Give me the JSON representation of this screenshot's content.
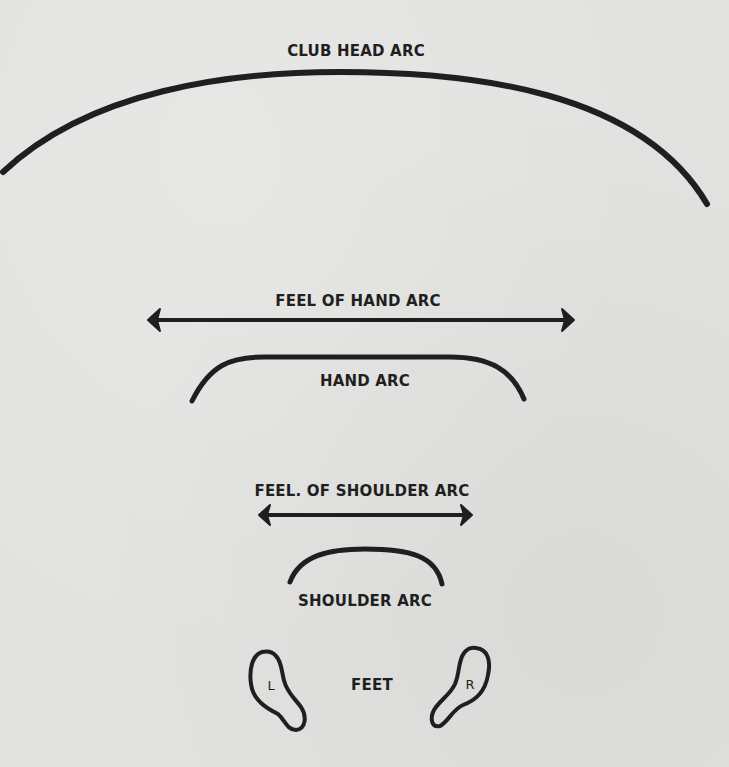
{
  "diagram": {
    "labels": {
      "club_head_arc": "CLUB HEAD ARC",
      "feel_of_hand_arc": "FEEL OF HAND ARC",
      "hand_arc": "HAND ARC",
      "feel_of_shoulder_arc": "FEEL. OF SHOULDER ARC",
      "shoulder_arc": "SHOULDER ARC",
      "feet": "FEET",
      "left_foot": "L",
      "right_foot": "R"
    },
    "colors": {
      "ink": "#1f1f1f",
      "paper": "#e2e2e0"
    }
  }
}
